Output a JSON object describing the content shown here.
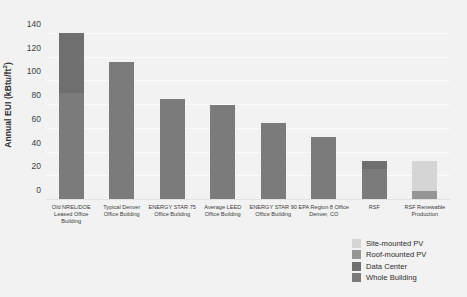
{
  "chart_data": {
    "type": "bar",
    "title": "",
    "xlabel": "",
    "ylabel": "Annual EUI (kBtu/ft",
    "ylabel_sup": "2",
    "ylabel_tail": ")",
    "ylim": [
      0,
      145
    ],
    "yticks": [
      0,
      20,
      40,
      60,
      80,
      100,
      120,
      140
    ],
    "ytick_labels": [
      "0",
      "20",
      "40",
      "60",
      "80",
      "100",
      "120",
      "140"
    ],
    "grid": true,
    "legend_position": "bottom-right",
    "stacked": true,
    "categories": [
      "Old NREL/DOE\nLeased Office\nBuilding",
      "Typical Denver\nOffice Building",
      "ENERGY STAR 75\nOffice Building",
      "Average LEED\nOffice Building",
      "ENERGY STAR 90\nOffice Building",
      "EPA Region 8 Office\nDenver, CO",
      "RSF",
      "RSF Renewable\nProduction"
    ],
    "series": [
      {
        "name": "Whole Building",
        "color": "#7b7b7b",
        "values": [
          90,
          116,
          85,
          80,
          65,
          53,
          26,
          0
        ]
      },
      {
        "name": "Data Center",
        "color": "#6f6f6f",
        "values": [
          51,
          0,
          0,
          0,
          0,
          0,
          7,
          0
        ]
      },
      {
        "name": "Roof-mounted PV",
        "color": "#959595",
        "values": [
          0,
          0,
          0,
          0,
          0,
          0,
          0,
          8
        ]
      },
      {
        "name": "Site-mounted PV",
        "color": "#d5d5d5",
        "values": [
          0,
          0,
          0,
          0,
          0,
          0,
          0,
          25
        ]
      }
    ],
    "totals": [
      141,
      116,
      85,
      80,
      65,
      53,
      33,
      33
    ],
    "legend": [
      {
        "label": "Site-mounted PV",
        "color": "#d5d5d5"
      },
      {
        "label": "Roof-mounted PV",
        "color": "#959595"
      },
      {
        "label": "Data Center",
        "color": "#6f6f6f"
      },
      {
        "label": "Whole Building",
        "color": "#7b7b7b"
      }
    ],
    "background_color": "#f2f2f2",
    "gridline_color": "#fbfbfb"
  }
}
